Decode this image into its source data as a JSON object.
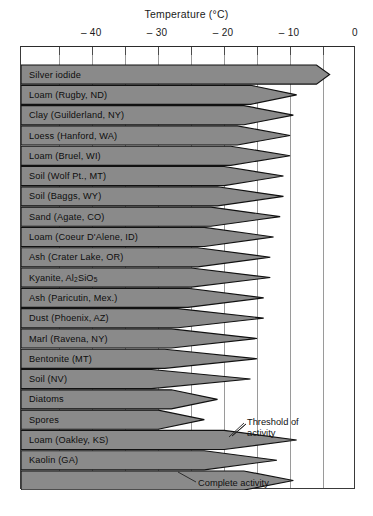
{
  "chart_data": {
    "type": "bar",
    "title": "Temperature (°C)",
    "xlabel": "Temperature (°C)",
    "ylabel": "",
    "xlim": [
      -50.8,
      0
    ],
    "grid": true,
    "legend": false,
    "tick_labels": [
      "– 40",
      "– 30",
      "– 20",
      "– 10",
      "0"
    ],
    "tick_values": [
      -40,
      -30,
      -20,
      -10,
      0
    ],
    "minor_tick_values": [
      -45,
      -40,
      -35,
      -30,
      -25,
      -20,
      -15,
      -10,
      -5
    ],
    "categories": [
      "Silver iodide",
      "Loam (Rugby, ND)",
      "Clay (Guilderland, NY)",
      "Loess (Hanford, WA)",
      "Loam (Bruel, WI)",
      "Soil (Wolf Pt., MT)",
      "Soil (Baggs, WY)",
      "Sand (Agate, CO)",
      "Loam (Coeur D'Alene, ID)",
      "Ash (Crater Lake, OR)",
      "Kyanite, Al2SiO5",
      "Ash (Paricutin, Mex.)",
      "Dust (Phoenix, AZ)",
      "Marl (Ravena, NY)",
      "Bentonite (MT)",
      "Soil (NV)",
      "Diatoms",
      "Spores",
      "Loam (Oakley, KS)",
      "Kaolin (GA)",
      ""
    ],
    "series": [
      {
        "name": "Threshold of activity",
        "values": [
          -4,
          -9,
          -9.5,
          -10,
          -10,
          -11,
          -11,
          -11.5,
          -12.5,
          -13,
          -13,
          -14,
          -14,
          -15,
          -15,
          -16,
          -21,
          -23,
          -9,
          -12,
          -9.5
        ]
      },
      {
        "name": "Complete activity",
        "values": [
          -6,
          -16,
          -17,
          -18,
          -19,
          -20,
          -21,
          -22,
          -23,
          -24,
          -25,
          -25.5,
          -27,
          -28,
          -29,
          -31,
          -28,
          -30,
          -20,
          -23,
          -17
        ]
      }
    ],
    "annotations": [
      {
        "text": "Threshold of",
        "text2": "activity"
      },
      {
        "text": "Complete activity"
      }
    ],
    "colors": {
      "wedge_fill": "#8a8a8a",
      "wedge_stroke": "#111111",
      "grid": "#9a9a9a",
      "frame": "#3a3a3a"
    }
  },
  "title": {
    "text": "Temperature (°C)"
  },
  "axis": {
    "labels": [
      {
        "text": "– 40"
      },
      {
        "text": "– 30"
      },
      {
        "text": "– 20"
      },
      {
        "text": "– 10"
      },
      {
        "text": "0"
      }
    ]
  },
  "rows": [
    {
      "label": "Silver iodide",
      "threshold": -4,
      "complete": -6
    },
    {
      "label": "Loam (Rugby, ND)",
      "threshold": -9,
      "complete": -16
    },
    {
      "label": "Clay (Guilderland, NY)",
      "threshold": -9.5,
      "complete": -17
    },
    {
      "label": "Loess (Hanford, WA)",
      "threshold": -10,
      "complete": -18
    },
    {
      "label": "Loam (Bruel, WI)",
      "threshold": -10,
      "complete": -19
    },
    {
      "label": "Soil (Wolf Pt., MT)",
      "threshold": -11,
      "complete": -20
    },
    {
      "label": "Soil (Baggs, WY)",
      "threshold": -11,
      "complete": -21
    },
    {
      "label": "Sand (Agate, CO)",
      "threshold": -11.5,
      "complete": -22
    },
    {
      "label": "Loam (Coeur D'Alene, ID)",
      "threshold": -12.5,
      "complete": -23
    },
    {
      "label": "Ash (Crater Lake, OR)",
      "threshold": -13,
      "complete": -24
    },
    {
      "label": "Kyanite, Al₂SiO₅",
      "threshold": -13,
      "complete": -25,
      "html": "Kyanite, Al<sub>2</sub>SiO<sub>5</sub>"
    },
    {
      "label": "Ash (Paricutin, Mex.)",
      "threshold": -14,
      "complete": -25.5
    },
    {
      "label": "Dust (Phoenix, AZ)",
      "threshold": -14,
      "complete": -27
    },
    {
      "label": "Marl (Ravena, NY)",
      "threshold": -15,
      "complete": -28
    },
    {
      "label": "Bentonite (MT)",
      "threshold": -15,
      "complete": -29
    },
    {
      "label": "Soil (NV)",
      "threshold": -16,
      "complete": -31
    },
    {
      "label": "Diatoms",
      "threshold": -21,
      "complete": -28
    },
    {
      "label": "Spores",
      "threshold": -23,
      "complete": -30
    },
    {
      "label": "Loam (Oakley, KS)",
      "threshold": -9,
      "complete": -20
    },
    {
      "label": "Kaolin (GA)",
      "threshold": -12,
      "complete": -23
    },
    {
      "label": "",
      "threshold": -9.5,
      "complete": -17
    }
  ],
  "annotations": {
    "threshold_line1": "Threshold of",
    "threshold_line2": "activity",
    "complete": "Complete activity"
  }
}
